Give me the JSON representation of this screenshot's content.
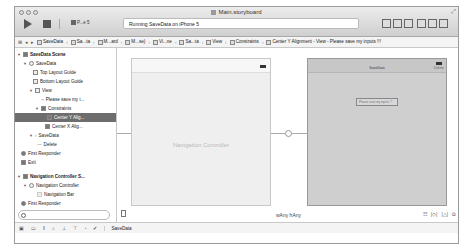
{
  "window": {
    "title": "Main.storyboard",
    "status": "Running SaveData on iPhone 5",
    "scheme": "P...e 5",
    "toolbar_icons": [
      "standard-editor-icon",
      "assistant-editor-icon",
      "version-editor-icon",
      "navigator-toggle-icon",
      "debug-area-toggle-icon",
      "utilities-toggle-icon"
    ]
  },
  "jumpbar": {
    "crumbs": [
      "SaveData",
      "Sa...ta",
      "M...ard",
      "M...se)",
      "Vi...ne",
      "Sa...ta",
      "View",
      "Constraints",
      "Center Y Alignment - View - Please save my inputs !!!"
    ]
  },
  "navigator": {
    "items": [
      {
        "label": "SaveData Scene",
        "level": 0,
        "bold": true,
        "expanded": true
      },
      {
        "label": "SaveData",
        "level": 1,
        "expanded": true
      },
      {
        "label": "Top Layout Guide",
        "level": 2
      },
      {
        "label": "Bottom Layout Guide",
        "level": 2
      },
      {
        "label": "View",
        "level": 2,
        "expanded": true
      },
      {
        "label": "Please save my i...",
        "level": 3
      },
      {
        "label": "Constraints",
        "level": 3,
        "expanded": true
      },
      {
        "label": "Center Y Alig...",
        "level": 4,
        "selected": true
      },
      {
        "label": "Center X Alig...",
        "level": 4
      },
      {
        "label": "SaveData",
        "level": 2,
        "expanded": true
      },
      {
        "label": "Delete",
        "level": 3
      },
      {
        "label": "First Responder",
        "level": 1
      },
      {
        "label": "Exit",
        "level": 1
      },
      {
        "label": "Navigation Controller S...",
        "level": 0,
        "bold": true,
        "expanded": true
      },
      {
        "label": "Navigation Controller",
        "level": 1,
        "expanded": true
      },
      {
        "label": "Navigation Bar",
        "level": 2
      },
      {
        "label": "First Responder",
        "level": 1
      },
      {
        "label": "Exit",
        "level": 1
      }
    ],
    "filter_placeholder": ""
  },
  "canvas": {
    "nav_controller": {
      "scene_label": "Navigation Controller",
      "center_text": "Navigation Controller"
    },
    "savedata": {
      "scene_label": "SaveData",
      "nav_title": "SaveData",
      "nav_button": "Delete",
      "field_text": "Please save my inputs !!!"
    },
    "size_class": "wAny hAny",
    "tools": [
      "☷",
      "|◇|",
      "|△|",
      "⧉"
    ]
  },
  "bottombar": {
    "debug_target": "SaveData",
    "icons": [
      "▣",
      "▭",
      "‖",
      "○",
      "⊥",
      "⊤",
      "◔",
      "✔"
    ]
  }
}
